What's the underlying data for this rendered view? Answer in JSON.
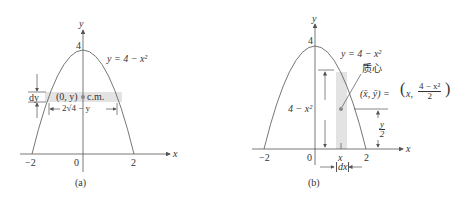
{
  "panel_a": {
    "caption": "(a)",
    "axis_x": "x",
    "axis_y": "y",
    "tick_neg2": "−2",
    "tick_0": "0",
    "tick_2": "2",
    "tick_4": "4",
    "curve_label": "y = 4 − x²",
    "dy_label": "dy",
    "point_label": "(0, y)",
    "cm_label": "c.m.",
    "width_label": "2√4 − y"
  },
  "panel_b": {
    "caption": "(b)",
    "axis_x": "x",
    "axis_y": "y",
    "tick_neg2": "−2",
    "tick_0": "0",
    "tick_2": "2",
    "tick_4": "4",
    "tick_x": "x",
    "curve_label": "y = 4 − x²",
    "centroid_label": "质心",
    "centroid_coords_left": "(x̄, ȳ)  =",
    "centroid_x": "x,",
    "centroid_num": "4 − x²",
    "centroid_den": "2",
    "height_label": "4 − x²",
    "half_num": "y",
    "half_den": "2",
    "dx_label": "dx"
  },
  "colors": {
    "line": "#555555",
    "strip": "#e3e3e3",
    "text": "#333333"
  }
}
